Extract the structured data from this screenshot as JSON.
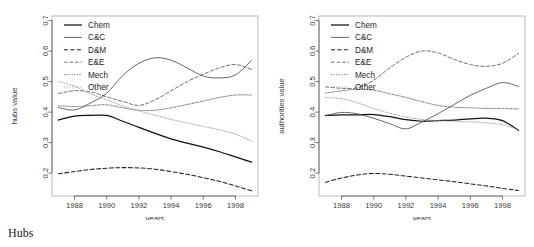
{
  "figure": {
    "panels": [
      {
        "id": "hubs",
        "caption": "Hubs",
        "ylabel": "hubs value",
        "xlabel": "years"
      },
      {
        "id": "authorities",
        "caption": "Authorities",
        "ylabel": "authorities value",
        "xlabel": "years"
      }
    ]
  },
  "chart_data": [
    {
      "type": "line",
      "title": "Hubs",
      "xlabel": "years",
      "ylabel": "hubs value",
      "xlim": [
        1986.6,
        1999.4
      ],
      "ylim": [
        0.125,
        0.715
      ],
      "xticks": [
        1988,
        1990,
        1992,
        1994,
        1996,
        1998
      ],
      "yticks": [
        0.2,
        0.3,
        0.4,
        0.5,
        0.6,
        0.7
      ],
      "grid": false,
      "legend_position": "top-left",
      "x": [
        1987,
        1988,
        1989,
        1990,
        1991,
        1992,
        1993,
        1994,
        1995,
        1996,
        1997,
        1998,
        1999
      ],
      "series": [
        {
          "name": "Chem",
          "style": "solid-thick",
          "values": [
            0.374,
            0.387,
            0.389,
            0.389,
            0.37,
            0.35,
            0.33,
            0.312,
            0.298,
            0.285,
            0.27,
            0.253,
            0.236
          ]
        },
        {
          "name": "C&C",
          "style": "solid-thin",
          "values": [
            0.415,
            0.407,
            0.43,
            0.462,
            0.52,
            0.56,
            0.578,
            0.57,
            0.545,
            0.518,
            0.512,
            0.522,
            0.57
          ]
        },
        {
          "name": "D&M",
          "style": "dashed",
          "values": [
            0.198,
            0.205,
            0.212,
            0.216,
            0.218,
            0.217,
            0.213,
            0.205,
            0.196,
            0.185,
            0.173,
            0.158,
            0.142
          ]
        },
        {
          "name": "E&E",
          "style": "dashed-thin",
          "values": [
            0.461,
            0.47,
            0.466,
            0.45,
            0.435,
            0.422,
            0.44,
            0.47,
            0.5,
            0.524,
            0.545,
            0.556,
            0.54
          ]
        },
        {
          "name": "Mech",
          "style": "dotted",
          "values": [
            0.421,
            0.418,
            0.421,
            0.424,
            0.414,
            0.406,
            0.406,
            0.414,
            0.425,
            0.436,
            0.448,
            0.456,
            0.456
          ]
        },
        {
          "name": "Other",
          "style": "dotted-light",
          "values": [
            0.5,
            0.485,
            0.46,
            0.44,
            0.42,
            0.404,
            0.39,
            0.376,
            0.364,
            0.353,
            0.342,
            0.328,
            0.305
          ]
        }
      ]
    },
    {
      "type": "line",
      "title": "Authorities",
      "xlabel": "years",
      "ylabel": "authorities value",
      "xlim": [
        1986.6,
        1999.4
      ],
      "ylim": [
        0.125,
        0.715
      ],
      "xticks": [
        1988,
        1990,
        1992,
        1994,
        1996,
        1998
      ],
      "yticks": [
        0.2,
        0.3,
        0.4,
        0.5,
        0.6,
        0.7
      ],
      "grid": false,
      "legend_position": "top-left",
      "x": [
        1987,
        1988,
        1989,
        1990,
        1991,
        1992,
        1993,
        1994,
        1995,
        1996,
        1997,
        1998,
        1999
      ],
      "series": [
        {
          "name": "Chem",
          "style": "solid-thick",
          "values": [
            0.389,
            0.391,
            0.391,
            0.392,
            0.385,
            0.375,
            0.37,
            0.372,
            0.374,
            0.378,
            0.38,
            0.372,
            0.34
          ]
        },
        {
          "name": "C&C",
          "style": "solid-thin",
          "values": [
            0.388,
            0.399,
            0.394,
            0.38,
            0.362,
            0.345,
            0.368,
            0.395,
            0.425,
            0.455,
            0.478,
            0.497,
            0.484
          ]
        },
        {
          "name": "D&M",
          "style": "dashed",
          "values": [
            0.17,
            0.184,
            0.194,
            0.199,
            0.196,
            0.19,
            0.184,
            0.178,
            0.172,
            0.165,
            0.158,
            0.15,
            0.143
          ]
        },
        {
          "name": "E&E",
          "style": "dashed-thin",
          "values": [
            0.483,
            0.478,
            0.48,
            0.505,
            0.545,
            0.58,
            0.6,
            0.594,
            0.573,
            0.556,
            0.55,
            0.56,
            0.592
          ]
        },
        {
          "name": "Mech",
          "style": "dotted",
          "values": [
            0.462,
            0.47,
            0.475,
            0.472,
            0.46,
            0.448,
            0.434,
            0.422,
            0.416,
            0.414,
            0.412,
            0.412,
            0.41
          ]
        },
        {
          "name": "Other",
          "style": "dotted-light",
          "values": [
            0.448,
            0.444,
            0.43,
            0.412,
            0.396,
            0.384,
            0.376,
            0.372,
            0.37,
            0.368,
            0.365,
            0.358,
            0.343
          ]
        }
      ]
    }
  ],
  "legend": {
    "entries": [
      "Chem",
      "C&C",
      "D&M",
      "E&E",
      "Mech",
      "Other"
    ]
  }
}
